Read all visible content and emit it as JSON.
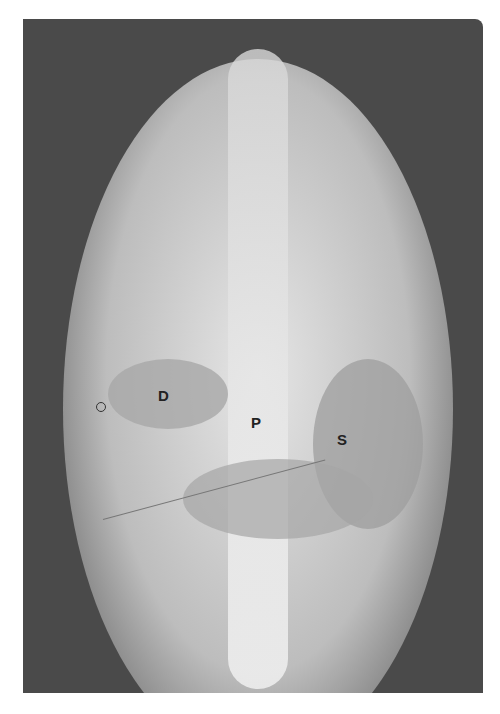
{
  "image": {
    "kind": "radiograph",
    "view": "frontal",
    "palette": {
      "background": "#ffffff",
      "film_dark": "#4a4a4a",
      "soft_tissue": "#c8c8c8",
      "bright": "#f2f2f2",
      "label": "#222222"
    }
  },
  "labels": [
    {
      "text": "D"
    },
    {
      "text": "P"
    },
    {
      "text": "S"
    }
  ],
  "marker": {
    "shape": "small ring"
  }
}
